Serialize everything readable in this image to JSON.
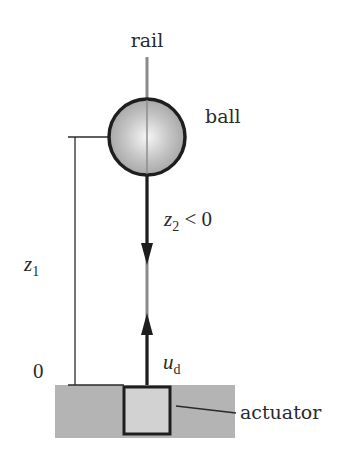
{
  "labels": {
    "rail": "rail",
    "ball": "ball",
    "actuator": "actuator",
    "zero": "0",
    "z1_var": "z",
    "z1_sub": "1",
    "z2_var": "z",
    "z2_sub": "2",
    "z2_rel": " < 0",
    "ud_var": "u",
    "ud_sub": "d"
  },
  "colors": {
    "rail": "#8a8a8a",
    "ball_stroke": "#1e1e1e",
    "ground": "#b4b4b4",
    "actuator_fill": "#d2d2d2",
    "line": "#2a2a2a"
  }
}
